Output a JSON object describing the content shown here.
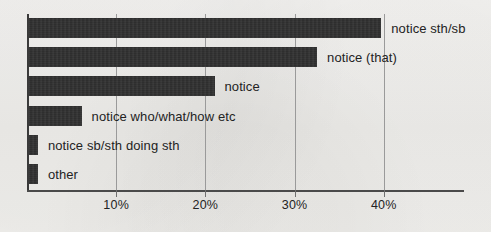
{
  "chart_data": {
    "type": "bar",
    "orientation": "horizontal",
    "title": "",
    "subtitle": "",
    "xlabel": "",
    "ylabel": "",
    "xlim": [
      0,
      49
    ],
    "grid": true,
    "legend": null,
    "categories": [
      "notice sth/sb",
      "notice (that)",
      "notice",
      "notice who/what/how etc",
      "notice sb/sth doing sth",
      "other"
    ],
    "values": [
      39.5,
      32.3,
      20.8,
      5.9,
      1.0,
      1.0
    ],
    "value_unit": "%",
    "xticks": [
      10,
      20,
      30,
      40
    ],
    "xticklabels": [
      "10%",
      "20%",
      "30%",
      "40%"
    ]
  },
  "style": {
    "bar_color": "#2e2e2e",
    "grid_color": "#9a9a9a",
    "axis_color": "#3a3a3a",
    "background": "#f2f1ef",
    "text_color": "#232323"
  }
}
